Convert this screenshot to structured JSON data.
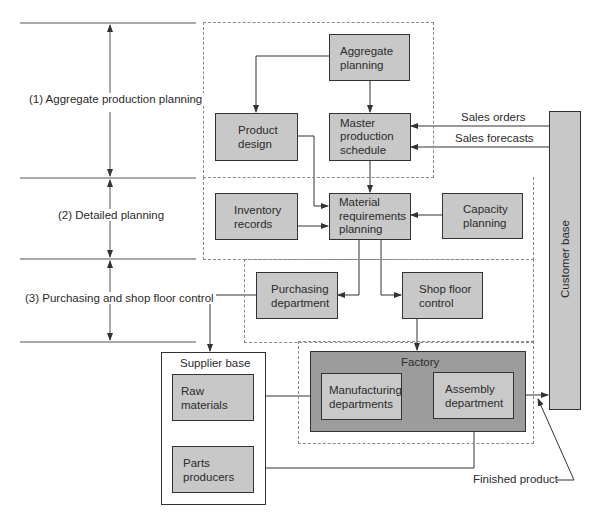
{
  "levels": [
    {
      "label": "(1) Aggregate production planning"
    },
    {
      "label": "(2) Detailed planning"
    },
    {
      "label": "(3) Purchasing and shop floor control"
    }
  ],
  "nodes": {
    "aggregate_planning": "Aggregate\nplanning",
    "product_design": "Product\ndesign",
    "master_production_schedule": "Master\nproduction\nschedule",
    "inventory_records": "Inventory\nrecords",
    "material_requirements_planning": "Material\nrequirements\nplanning",
    "capacity_planning": "Capacity\nplanning",
    "purchasing_department": "Purchasing\ndepartment",
    "shop_floor_control": "Shop floor\ncontrol",
    "customer_base": "Customer base",
    "supplier_base": "Supplier base",
    "raw_materials": "Raw materials",
    "parts_producers": "Parts\nproducers",
    "factory": "Factory",
    "manufacturing_departments": "Manufacturing\ndepartments",
    "assembly_department": "Assembly\ndepartment"
  },
  "edge_labels": {
    "sales_orders": "Sales orders",
    "sales_forecasts": "Sales forecasts",
    "finished_product": "Finished product"
  },
  "colors": {
    "box_fill": "#c8c8c8",
    "factory_fill": "#9c9c9c",
    "line": "#333333",
    "dashed": "#8a8a8a"
  }
}
